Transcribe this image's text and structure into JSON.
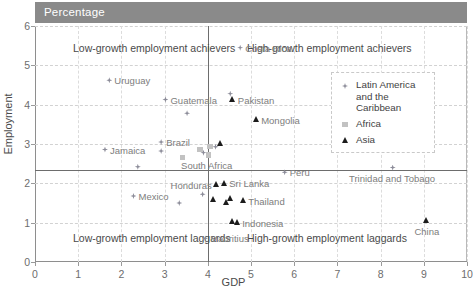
{
  "header": {
    "band_label": "Percentage"
  },
  "chart_data": {
    "type": "scatter",
    "title": "Percentage",
    "xlabel": "GDP",
    "ylabel": "Employment",
    "xlim": [
      0,
      10
    ],
    "ylim": [
      0,
      6
    ],
    "xticks": [
      0,
      1,
      2,
      3,
      4,
      5,
      6,
      7,
      8,
      9,
      10
    ],
    "yticks": [
      0,
      1,
      2,
      3,
      4,
      5,
      6
    ],
    "grid": "dashed horizontal and vertical gridlines",
    "legend_position": "upper-right inside plot",
    "reference_lines": {
      "vertical_x": 4.0,
      "horizontal_y": 2.35
    },
    "quadrant_labels": [
      {
        "text": "Low-growth employment achievers",
        "quadrant": "top-left"
      },
      {
        "text": "High-growth employment achievers",
        "quadrant": "top-right"
      },
      {
        "text": "Low-growth employment laggards",
        "quadrant": "bottom-left"
      },
      {
        "text": "High-growth employment laggards",
        "quadrant": "bottom-right"
      }
    ],
    "legend": [
      {
        "name": "Latin America and the Caribbean",
        "marker": "diamond",
        "color": "#8c8c99"
      },
      {
        "name": "Africa",
        "marker": "square",
        "color": "#c2c2c2"
      },
      {
        "name": "Asia",
        "marker": "triangle",
        "color": "#1c1c1c"
      }
    ],
    "series": [
      {
        "name": "Latin America and the Caribbean",
        "marker": "diamond",
        "color": "#8c8c99",
        "points": [
          {
            "label": "Costa Rica",
            "x": 4.75,
            "y": 5.45,
            "label_pos": "right"
          },
          {
            "label": "Uruguay",
            "x": 1.72,
            "y": 4.62,
            "label_pos": "right"
          },
          {
            "label": "Guatemala",
            "x": 3.02,
            "y": 4.13,
            "label_pos": "right"
          },
          {
            "label": "",
            "x": 3.52,
            "y": 3.78,
            "label_pos": "right"
          },
          {
            "label": "Brazil",
            "x": 2.92,
            "y": 3.05,
            "label_pos": "right"
          },
          {
            "label": "",
            "x": 2.92,
            "y": 2.82,
            "label_pos": "right"
          },
          {
            "label": "Jamaica",
            "x": 1.62,
            "y": 2.86,
            "label_pos": "right"
          },
          {
            "label": "",
            "x": 4.52,
            "y": 4.28,
            "label_pos": "right"
          },
          {
            "label": "",
            "x": 4.18,
            "y": 2.93,
            "label_pos": "right"
          },
          {
            "label": "",
            "x": 3.9,
            "y": 2.78,
            "label_pos": "right"
          },
          {
            "label": "",
            "x": 2.38,
            "y": 2.42,
            "label_pos": "right"
          },
          {
            "label": "Trinidad and Tobago",
            "x": 8.28,
            "y": 2.4,
            "label_pos": "below"
          },
          {
            "label": "Peru",
            "x": 5.78,
            "y": 2.28,
            "label_pos": "right"
          },
          {
            "label": "Honduras",
            "x": 3.88,
            "y": 1.72,
            "label_pos": "above"
          },
          {
            "label": "Mexico",
            "x": 2.28,
            "y": 1.68,
            "label_pos": "right"
          },
          {
            "label": "",
            "x": 3.34,
            "y": 1.5,
            "label_pos": "right"
          },
          {
            "label": "Mauritius",
            "x": 3.94,
            "y": 0.6,
            "label_pos": "right"
          }
        ]
      },
      {
        "name": "Africa",
        "marker": "square",
        "color": "#c2c2c2",
        "points": [
          {
            "label": "",
            "x": 3.82,
            "y": 2.86,
            "label_pos": "right"
          },
          {
            "label": "",
            "x": 4.05,
            "y": 2.93,
            "label_pos": "right"
          },
          {
            "label": "South Africa",
            "x": 4.02,
            "y": 2.72,
            "label_pos": "below"
          },
          {
            "label": "",
            "x": 3.42,
            "y": 2.65,
            "label_pos": "right"
          }
        ]
      },
      {
        "name": "Asia",
        "marker": "triangle",
        "color": "#1c1c1c",
        "points": [
          {
            "label": "Pakistan",
            "x": 4.58,
            "y": 4.12,
            "label_pos": "right"
          },
          {
            "label": "Mongolia",
            "x": 5.12,
            "y": 3.62,
            "label_pos": "right"
          },
          {
            "label": "",
            "x": 4.3,
            "y": 3.02,
            "label_pos": "right"
          },
          {
            "label": "Sri Lanka",
            "x": 4.38,
            "y": 2.0,
            "label_pos": "right"
          },
          {
            "label": "",
            "x": 4.2,
            "y": 1.98,
            "label_pos": "right"
          },
          {
            "label": "",
            "x": 4.12,
            "y": 1.58,
            "label_pos": "right"
          },
          {
            "label": "",
            "x": 4.52,
            "y": 1.62,
            "label_pos": "right"
          },
          {
            "label": "",
            "x": 4.44,
            "y": 1.52,
            "label_pos": "right"
          },
          {
            "label": "Thailand",
            "x": 4.82,
            "y": 1.55,
            "label_pos": "right"
          },
          {
            "label": "",
            "x": 4.56,
            "y": 1.02,
            "label_pos": "right"
          },
          {
            "label": "Indonesia",
            "x": 4.68,
            "y": 1.0,
            "label_pos": "right"
          },
          {
            "label": "China",
            "x": 9.05,
            "y": 1.05,
            "label_pos": "below"
          }
        ]
      }
    ]
  }
}
